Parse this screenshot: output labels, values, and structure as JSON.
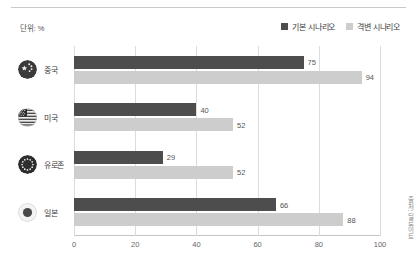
{
  "unit_label": "단위: %",
  "legend": {
    "items": [
      {
        "label": "기본 시나리오",
        "color": "#4d4d4d",
        "icon": "legend-swatch-square"
      },
      {
        "label": "격변 시나리오",
        "color": "#cdcdcd",
        "icon": "legend-swatch-square"
      }
    ]
  },
  "source_note": "출처: 딜로이트",
  "colors": {
    "series_base": "#4d4d4d",
    "series_disruption": "#cdcdcd",
    "gridline": "#dcdcdc",
    "axis": "#c5c5c5",
    "text": "#3c3c3c",
    "value_text": "#555555"
  },
  "chart_data": {
    "type": "bar",
    "orientation": "horizontal",
    "title": "",
    "subtitle": "",
    "xlabel": "",
    "ylabel": "",
    "unit": "%",
    "xlim": [
      0,
      100
    ],
    "xticks": [
      "0",
      "20",
      "40",
      "60",
      "80",
      "100"
    ],
    "grid": true,
    "legend_position": "top-right",
    "categories": [
      "중국",
      "미국",
      "유로존",
      "일본"
    ],
    "category_icons": [
      "flag-china",
      "flag-usa",
      "flag-eurozone",
      "flag-japan"
    ],
    "series": [
      {
        "name": "기본 시나리오",
        "color": "#4d4d4d",
        "values": [
          75,
          40,
          29,
          66
        ]
      },
      {
        "name": "격변 시나리오",
        "color": "#cdcdcd",
        "values": [
          94,
          52,
          52,
          88
        ]
      }
    ]
  }
}
